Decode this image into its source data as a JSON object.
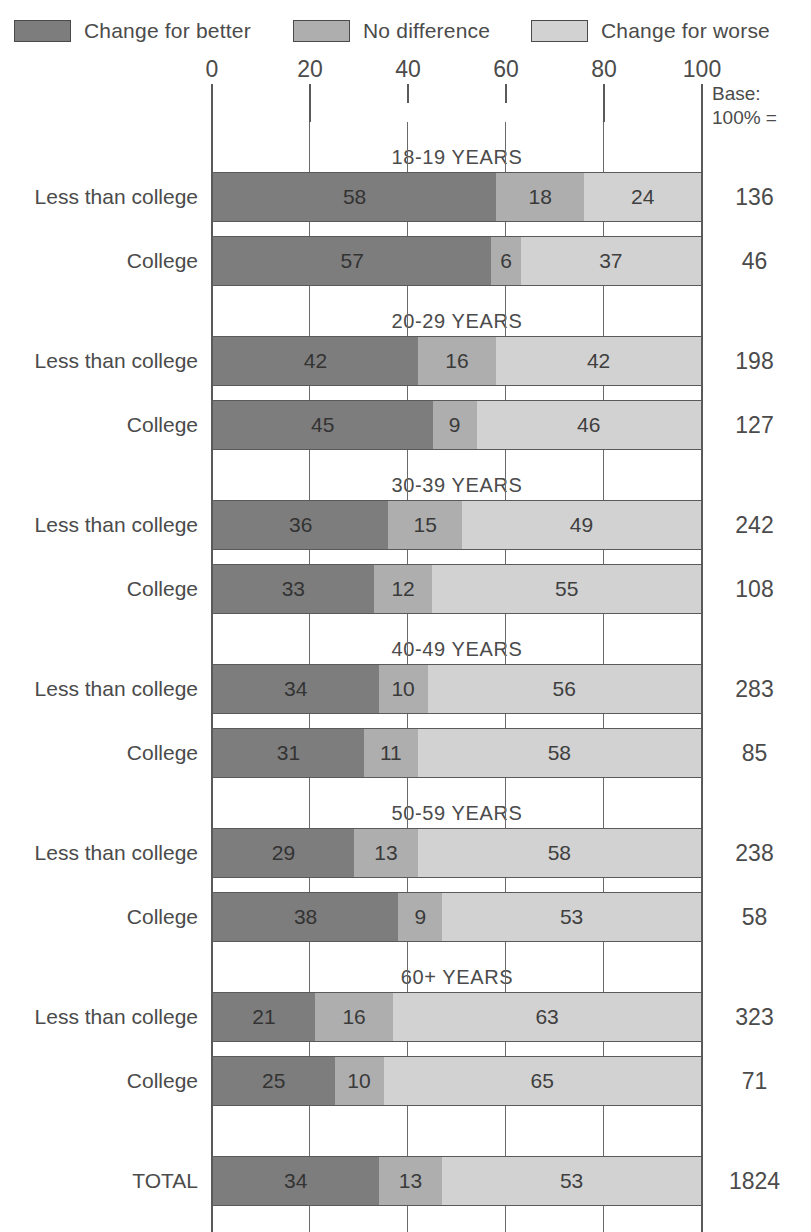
{
  "chart_data": {
    "type": "bar",
    "subtype": "stacked-horizontal-100pct",
    "title": "",
    "xlabel": "",
    "ylabel": "",
    "xlim": [
      0,
      100
    ],
    "xticks": [
      0,
      20,
      40,
      60,
      80,
      100
    ],
    "xtick_labels": [
      "0",
      "20",
      "40",
      "60",
      "80",
      "100"
    ],
    "grid": true,
    "legend_position": "top",
    "base_header_line1": "Base:",
    "base_header_line2": "100% =",
    "series": [
      {
        "name": "Change for better",
        "key": "better",
        "color": "#7d7d7d"
      },
      {
        "name": "No difference",
        "key": "same",
        "color": "#aeaeae"
      },
      {
        "name": "Change for worse",
        "key": "worse",
        "color": "#d2d2d2"
      }
    ],
    "groups": [
      {
        "title": "18-19 YEARS",
        "rows": [
          {
            "label": "Less than college",
            "values": [
              58,
              18,
              24
            ],
            "base": "136"
          },
          {
            "label": "College",
            "values": [
              57,
              6,
              37
            ],
            "base": "46"
          }
        ]
      },
      {
        "title": "20-29 YEARS",
        "rows": [
          {
            "label": "Less than college",
            "values": [
              42,
              16,
              42
            ],
            "base": "198"
          },
          {
            "label": "College",
            "values": [
              45,
              9,
              46
            ],
            "base": "127"
          }
        ]
      },
      {
        "title": "30-39 YEARS",
        "rows": [
          {
            "label": "Less than college",
            "values": [
              36,
              15,
              49
            ],
            "base": "242"
          },
          {
            "label": "College",
            "values": [
              33,
              12,
              55
            ],
            "base": "108"
          }
        ]
      },
      {
        "title": "40-49 YEARS",
        "rows": [
          {
            "label": "Less than college",
            "values": [
              34,
              10,
              56
            ],
            "base": "283"
          },
          {
            "label": "College",
            "values": [
              31,
              11,
              58
            ],
            "base": "85"
          }
        ]
      },
      {
        "title": "50-59 YEARS",
        "rows": [
          {
            "label": "Less than college",
            "values": [
              29,
              13,
              58
            ],
            "base": "238"
          },
          {
            "label": "College",
            "values": [
              38,
              9,
              53
            ],
            "base": "58"
          }
        ]
      },
      {
        "title": "60+ YEARS",
        "rows": [
          {
            "label": "Less than college",
            "values": [
              21,
              16,
              63
            ],
            "base": "323"
          },
          {
            "label": "College",
            "values": [
              25,
              10,
              65
            ],
            "base": "71"
          }
        ]
      },
      {
        "title": "",
        "rows": [
          {
            "label": "TOTAL",
            "values": [
              34,
              13,
              53
            ],
            "base": "1824"
          }
        ]
      }
    ]
  }
}
